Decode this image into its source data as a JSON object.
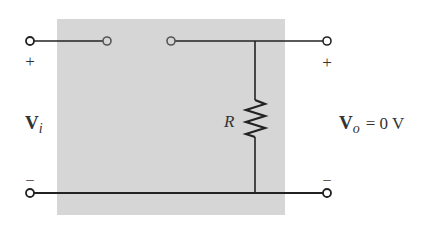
{
  "diagram": {
    "type": "circuit",
    "colors": {
      "background": "#ffffff",
      "shaded_box": "#d6d6d6",
      "wire": "#222222",
      "terminal_fill": "#ffffff",
      "terminal_stroke": "#333333",
      "switch_contact_stroke": "#555555",
      "text": "#333333"
    },
    "input": {
      "label_main": "V",
      "label_sub": "i",
      "plus": "+",
      "minus": "–"
    },
    "output": {
      "label_main": "V",
      "label_sub": "o",
      "equation": "= 0 V",
      "plus": "+",
      "minus": "–"
    },
    "resistor": {
      "label": "R"
    },
    "switch": {
      "state": "open"
    }
  }
}
